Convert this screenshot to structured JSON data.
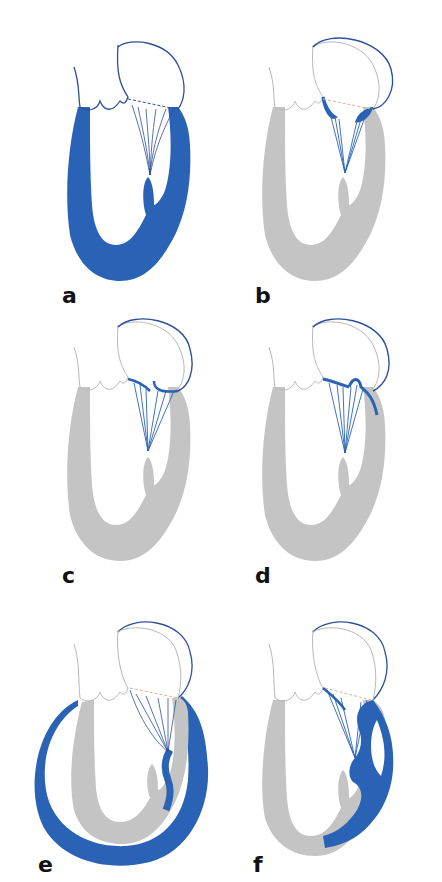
{
  "colors": {
    "highlight": "#2a63b5",
    "myocardium": "#c4c4c4",
    "outline_dark": "#2e4f9a",
    "outline_light": "#b8b8b8",
    "background": "#ffffff"
  },
  "panels": [
    {
      "label": "a",
      "description": "Whole left ventricular wall highlighted"
    },
    {
      "label": "b",
      "description": "Mitral leaflet tips and left atrial wall highlighted"
    },
    {
      "label": "c",
      "description": "Mitral annulus and chordae highlighted"
    },
    {
      "label": "d",
      "description": "Posterior mitral annulus region highlighted"
    },
    {
      "label": "e",
      "description": "Pericardium-like outer ring highlighted around ventricle"
    },
    {
      "label": "f",
      "description": "Posterior papillary muscle and inferior wall highlighted"
    }
  ]
}
